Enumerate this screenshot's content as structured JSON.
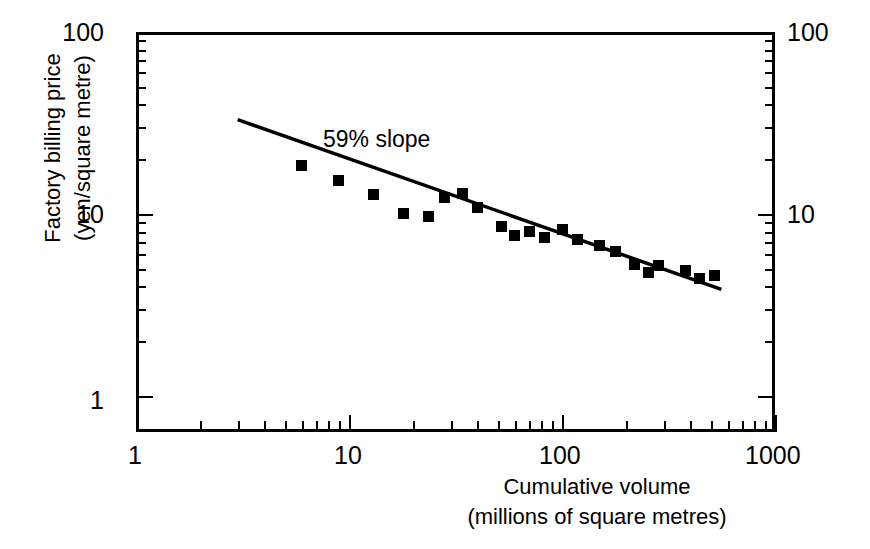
{
  "chart_data": {
    "type": "scatter",
    "title": "",
    "xlabel": "Cumulative volume (millions of square metres)",
    "xlabel_line1": "Cumulative volume",
    "xlabel_line2": "(millions of square metres)",
    "ylabel": "Factory billing price (yen/square metre)",
    "ylabel_line1": "Factory billing price",
    "ylabel_line2": "(yen/square metre)",
    "xscale": "log",
    "yscale": "log",
    "xlim": [
      1,
      1000
    ],
    "ylim": [
      1,
      100
    ],
    "x_ticklabels": [
      "1",
      "10",
      "100",
      "1000"
    ],
    "x_tickvalues": [
      1,
      10,
      100,
      1000
    ],
    "y_ticklabels": [
      "1",
      "10",
      "100"
    ],
    "y_tickvalues": [
      1,
      10,
      100
    ],
    "y_ticklabels_right": [
      "10",
      "100"
    ],
    "grid": false,
    "legend": false,
    "annotations": [
      {
        "text": "59% slope",
        "x": 28,
        "y": 27
      }
    ],
    "marker_style": "filled-square",
    "marker_color": "#000000",
    "line_color": "#000000",
    "series": [
      {
        "name": "Factory billing price vs cumulative volume",
        "points": [
          {
            "x": 6.0,
            "y": 18.5
          },
          {
            "x": 8.9,
            "y": 15.2
          },
          {
            "x": 13.0,
            "y": 12.8
          },
          {
            "x": 18.0,
            "y": 10.1
          },
          {
            "x": 23.5,
            "y": 9.7
          },
          {
            "x": 28.0,
            "y": 12.3
          },
          {
            "x": 34.0,
            "y": 13.0
          },
          {
            "x": 40.0,
            "y": 10.8
          },
          {
            "x": 52.0,
            "y": 8.5
          },
          {
            "x": 60.0,
            "y": 7.6
          },
          {
            "x": 70.0,
            "y": 8.0
          },
          {
            "x": 83.0,
            "y": 7.4
          },
          {
            "x": 100.0,
            "y": 8.2
          },
          {
            "x": 118.0,
            "y": 7.2
          },
          {
            "x": 150.0,
            "y": 6.7
          },
          {
            "x": 178.0,
            "y": 6.2
          },
          {
            "x": 220.0,
            "y": 5.3
          },
          {
            "x": 255.0,
            "y": 4.8
          },
          {
            "x": 285.0,
            "y": 5.2
          },
          {
            "x": 380.0,
            "y": 4.9
          },
          {
            "x": 440.0,
            "y": 4.4
          },
          {
            "x": 520.0,
            "y": 4.6
          }
        ]
      }
    ],
    "fit_line": {
      "label": "59% slope",
      "slope_percent": 59,
      "endpoints": [
        {
          "x": 3.0,
          "y": 33.0
        },
        {
          "x": 560.0,
          "y": 3.85
        }
      ]
    }
  }
}
